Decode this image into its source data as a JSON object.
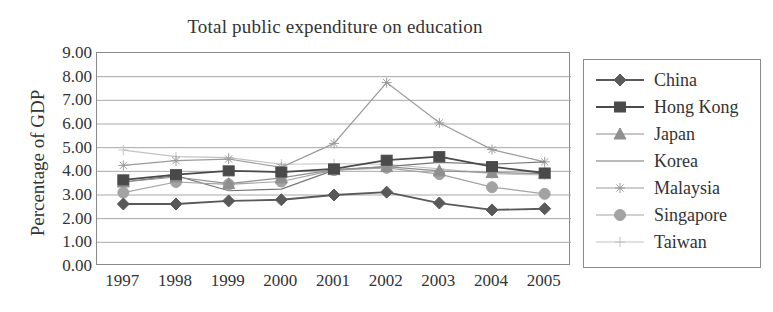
{
  "chart_data": {
    "type": "line",
    "title": "Total public expenditure on education",
    "xlabel": "",
    "ylabel": "Percentage of GDP",
    "categories": [
      "1997",
      "1998",
      "1999",
      "2000",
      "2001",
      "2002",
      "2003",
      "2004",
      "2005"
    ],
    "ylim": [
      0,
      9
    ],
    "ytick_labels": [
      "9.00",
      "8.00",
      "7.00",
      "6.00",
      "5.00",
      "4.00",
      "3.00",
      "2.00",
      "1.00",
      "0.00"
    ],
    "ytick_values": [
      9,
      8,
      7,
      6,
      5,
      4,
      3,
      2,
      1,
      0
    ],
    "grid": true,
    "grid_axis": "y",
    "legend_position": "right",
    "series": [
      {
        "name": "China",
        "marker": "diamond",
        "color": "#595959",
        "values": [
          2.62,
          2.62,
          2.75,
          2.8,
          3.0,
          3.12,
          2.66,
          2.37,
          2.42
        ]
      },
      {
        "name": "Hong Kong",
        "marker": "square",
        "color": "#4a4a4a",
        "values": [
          3.64,
          3.86,
          4.02,
          3.97,
          4.1,
          4.47,
          4.62,
          4.2,
          3.93
        ]
      },
      {
        "name": "Japan",
        "marker": "triangle",
        "color": "#8f8f8f",
        "values": [
          3.55,
          3.76,
          3.48,
          3.72,
          4.07,
          4.2,
          4.02,
          3.95,
          3.9
        ]
      },
      {
        "name": "Korea",
        "marker": "none",
        "color": "#767676",
        "values": [
          3.55,
          3.82,
          3.18,
          3.25,
          4.05,
          4.2,
          4.38,
          4.3,
          4.4
        ]
      },
      {
        "name": "Malaysia",
        "marker": "star",
        "color": "#9b9b9b",
        "values": [
          4.25,
          4.45,
          4.52,
          4.17,
          5.18,
          7.75,
          6.05,
          4.92,
          4.4
        ]
      },
      {
        "name": "Singapore",
        "marker": "circle",
        "color": "#a3a3a3",
        "values": [
          3.1,
          3.55,
          3.45,
          3.57,
          4.05,
          4.15,
          3.88,
          3.33,
          3.05
        ]
      },
      {
        "name": "Taiwan",
        "marker": "plus",
        "color": "#c2c2c2",
        "values": [
          4.9,
          4.62,
          4.58,
          4.3,
          4.32,
          4.3,
          4.1,
          3.9,
          3.85
        ]
      }
    ]
  },
  "legend": {
    "items": [
      {
        "label": "China"
      },
      {
        "label": "Hong Kong"
      },
      {
        "label": "Japan"
      },
      {
        "label": "Korea"
      },
      {
        "label": "Malaysia"
      },
      {
        "label": "Singapore"
      },
      {
        "label": "Taiwan"
      }
    ]
  }
}
